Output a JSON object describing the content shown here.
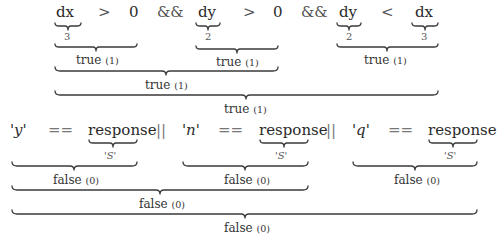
{
  "expression1": {
    "tokens": [
      {
        "text": "dx",
        "kind": "operand",
        "value": "3"
      },
      {
        "text": ">",
        "kind": "operator"
      },
      {
        "text": "0",
        "kind": "operand"
      },
      {
        "text": "&&",
        "kind": "operator"
      },
      {
        "text": "dy",
        "kind": "operand",
        "value": "2"
      },
      {
        "text": ">",
        "kind": "operator"
      },
      {
        "text": "0",
        "kind": "operand"
      },
      {
        "text": "&&",
        "kind": "operator"
      },
      {
        "text": "dy",
        "kind": "operand",
        "value": "2"
      },
      {
        "text": "<",
        "kind": "operator"
      },
      {
        "text": "dx",
        "kind": "operand",
        "value": "3"
      }
    ],
    "sub_results": [
      {
        "text": "true",
        "num": "(1)"
      },
      {
        "text": "true",
        "num": "(1)"
      },
      {
        "text": "true",
        "num": "(1)"
      }
    ],
    "combined_12": {
      "text": "true",
      "num": "(1)"
    },
    "final": {
      "text": "true",
      "num": "(1)"
    }
  },
  "expression2": {
    "tokens": [
      {
        "text": "'y'",
        "kind": "char-literal"
      },
      {
        "text": "==",
        "kind": "operator"
      },
      {
        "text": "response",
        "kind": "operand",
        "value": "'S'"
      },
      {
        "text": "||",
        "kind": "operator"
      },
      {
        "text": "'n'",
        "kind": "char-literal"
      },
      {
        "text": "==",
        "kind": "operator"
      },
      {
        "text": "response",
        "kind": "operand",
        "value": "'S'"
      },
      {
        "text": "||",
        "kind": "operator"
      },
      {
        "text": "'q'",
        "kind": "char-literal"
      },
      {
        "text": "==",
        "kind": "operator"
      },
      {
        "text": "response",
        "kind": "operand",
        "value": "'S'"
      }
    ],
    "sub_results": [
      {
        "text": "false",
        "num": "(0)"
      },
      {
        "text": "false",
        "num": "(0)"
      },
      {
        "text": "false",
        "num": "(0)"
      }
    ],
    "combined_12": {
      "text": "false",
      "num": "(0)"
    },
    "final": {
      "text": "false",
      "num": "(0)"
    }
  }
}
